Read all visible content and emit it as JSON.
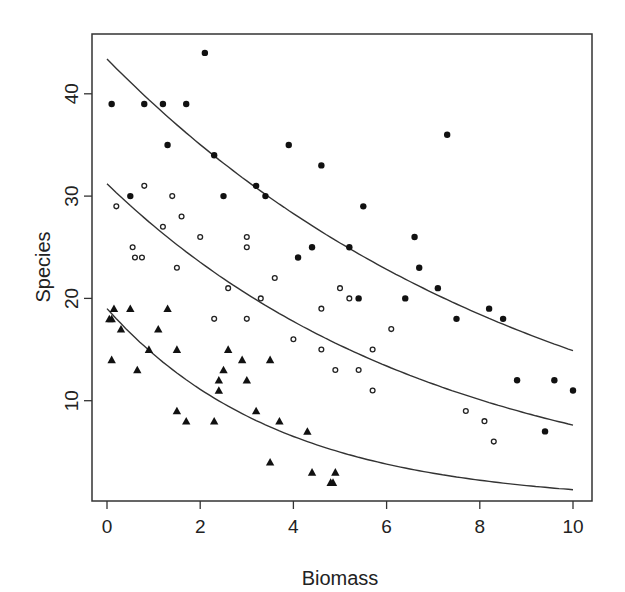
{
  "chart_data": {
    "type": "scatter",
    "title": "",
    "xlabel": "Biomass",
    "ylabel": "Species",
    "xlim": [
      -0.3,
      10.4
    ],
    "ylim": [
      0,
      45.6
    ],
    "grid": false,
    "legend": null,
    "x_ticks": [
      0,
      2,
      4,
      6,
      8,
      10
    ],
    "x_tick_labels": [
      "0",
      "2",
      "4",
      "6",
      "8",
      "10"
    ],
    "y_ticks": [
      10,
      20,
      30,
      40
    ],
    "y_tick_labels": [
      "10",
      "20",
      "30",
      "40"
    ],
    "series": [
      {
        "name": "group-high",
        "marker": "filled-circle",
        "points": [
          [
            0.1,
            39
          ],
          [
            0.8,
            39
          ],
          [
            1.2,
            39
          ],
          [
            1.7,
            39
          ],
          [
            2.1,
            44
          ],
          [
            1.3,
            35
          ],
          [
            2.3,
            34
          ],
          [
            3.2,
            31
          ],
          [
            3.4,
            30
          ],
          [
            0.5,
            30
          ],
          [
            2.5,
            30
          ],
          [
            3.9,
            35
          ],
          [
            4.6,
            33
          ],
          [
            7.3,
            36
          ],
          [
            5.5,
            29
          ],
          [
            6.6,
            26
          ],
          [
            4.4,
            25
          ],
          [
            5.2,
            25
          ],
          [
            4.1,
            24
          ],
          [
            6.7,
            23
          ],
          [
            5.4,
            20
          ],
          [
            6.4,
            20
          ],
          [
            7.1,
            21
          ],
          [
            7.5,
            18
          ],
          [
            8.2,
            19
          ],
          [
            8.5,
            18
          ],
          [
            8.8,
            12
          ],
          [
            9.6,
            12
          ],
          [
            10.0,
            11
          ],
          [
            9.4,
            7
          ]
        ],
        "fit": {
          "model": "exponential",
          "a": 43.4,
          "b": -0.107,
          "x_range": [
            0,
            10
          ]
        }
      },
      {
        "name": "group-mid",
        "marker": "open-circle",
        "points": [
          [
            0.2,
            29
          ],
          [
            0.8,
            31
          ],
          [
            1.4,
            30
          ],
          [
            1.6,
            28
          ],
          [
            1.2,
            27
          ],
          [
            2.0,
            26
          ],
          [
            3.0,
            26
          ],
          [
            3.0,
            25
          ],
          [
            0.55,
            25
          ],
          [
            0.6,
            24
          ],
          [
            0.75,
            24
          ],
          [
            1.5,
            23
          ],
          [
            2.6,
            21
          ],
          [
            3.3,
            20
          ],
          [
            2.3,
            18
          ],
          [
            3.0,
            18
          ],
          [
            3.6,
            22
          ],
          [
            5.0,
            21
          ],
          [
            5.2,
            20
          ],
          [
            4.6,
            19
          ],
          [
            6.1,
            17
          ],
          [
            4.0,
            16
          ],
          [
            4.6,
            15
          ],
          [
            5.7,
            15
          ],
          [
            4.9,
            13
          ],
          [
            5.4,
            13
          ],
          [
            5.7,
            11
          ],
          [
            7.7,
            9
          ],
          [
            8.1,
            8
          ],
          [
            8.3,
            6
          ]
        ],
        "fit": {
          "model": "exponential",
          "a": 31.2,
          "b": -0.141,
          "x_range": [
            0,
            10
          ]
        }
      },
      {
        "name": "group-low",
        "marker": "filled-triangle",
        "points": [
          [
            0.15,
            19
          ],
          [
            0.5,
            19
          ],
          [
            1.3,
            19
          ],
          [
            0.1,
            18
          ],
          [
            0.05,
            18
          ],
          [
            0.3,
            17
          ],
          [
            1.1,
            17
          ],
          [
            0.9,
            15
          ],
          [
            1.5,
            15
          ],
          [
            2.6,
            15
          ],
          [
            0.1,
            14
          ],
          [
            2.9,
            14
          ],
          [
            3.5,
            14
          ],
          [
            0.65,
            13
          ],
          [
            2.5,
            13
          ],
          [
            2.4,
            12
          ],
          [
            3.0,
            12
          ],
          [
            2.4,
            11
          ],
          [
            1.5,
            9
          ],
          [
            1.7,
            8
          ],
          [
            2.3,
            8
          ],
          [
            3.2,
            9
          ],
          [
            3.7,
            8
          ],
          [
            4.3,
            7
          ],
          [
            3.5,
            4
          ],
          [
            4.4,
            3
          ],
          [
            4.9,
            3
          ],
          [
            4.8,
            2
          ],
          [
            4.85,
            2
          ]
        ],
        "fit": {
          "model": "exponential",
          "a": 19.0,
          "b": -0.268,
          "x_range": [
            0,
            10
          ]
        }
      }
    ]
  }
}
